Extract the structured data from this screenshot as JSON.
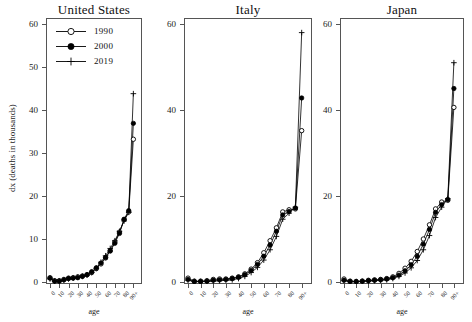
{
  "figure": {
    "ylabel": "dx (deaths in thousands)",
    "xlabel": "age"
  },
  "legend": {
    "entries": [
      {
        "label": "1990",
        "marker": "open-circle",
        "color": "#000000"
      },
      {
        "label": "2000",
        "marker": "filled-circle",
        "color": "#000000"
      },
      {
        "label": "2019",
        "marker": "plus",
        "color": "#000000"
      }
    ]
  },
  "chart_data": [
    {
      "type": "line",
      "title": "United States",
      "xlabel": "age",
      "ylabel": "dx (deaths in thousands)",
      "xlim": [
        0,
        95
      ],
      "ylim": [
        0,
        60
      ],
      "yticks": [
        0,
        10,
        20,
        30,
        40,
        50,
        60
      ],
      "xticks": [
        "0",
        "10",
        "20",
        "30",
        "40",
        "50",
        "60",
        "70",
        "80",
        "90+"
      ],
      "grid": false,
      "legend_position": "top-left",
      "x": [
        0,
        5,
        10,
        15,
        20,
        25,
        30,
        35,
        40,
        45,
        50,
        55,
        60,
        65,
        70,
        75,
        80,
        85,
        90
      ],
      "series": [
        {
          "name": "1990",
          "marker": "open-circle",
          "values": [
            1.0,
            0.3,
            0.3,
            0.6,
            0.9,
            1.0,
            1.2,
            1.4,
            1.7,
            2.2,
            3.1,
            4.2,
            5.6,
            7.3,
            9.3,
            11.6,
            14.5,
            16.3,
            33.2
          ]
        },
        {
          "name": "2000",
          "marker": "filled-circle",
          "values": [
            0.9,
            0.2,
            0.2,
            0.5,
            0.8,
            0.9,
            1.0,
            1.3,
            1.7,
            2.4,
            3.3,
            4.4,
            5.7,
            7.2,
            9.0,
            11.3,
            14.6,
            16.6,
            36.9
          ]
        },
        {
          "name": "2019",
          "marker": "plus",
          "values": [
            0.7,
            0.2,
            0.2,
            0.4,
            0.7,
            0.9,
            1.1,
            1.3,
            1.6,
            2.2,
            3.2,
            4.6,
            6.1,
            7.8,
            9.6,
            11.8,
            14.2,
            16.2,
            43.8
          ]
        }
      ]
    },
    {
      "type": "line",
      "title": "Italy",
      "xlabel": "age",
      "ylabel": "",
      "xlim": [
        0,
        95
      ],
      "ylim": [
        0,
        60
      ],
      "yticks": [
        0,
        20,
        40,
        60
      ],
      "xticks": [
        "0",
        "10",
        "20",
        "30",
        "40",
        "50",
        "60",
        "70",
        "80",
        "90+"
      ],
      "grid": false,
      "x": [
        0,
        5,
        10,
        15,
        20,
        25,
        30,
        35,
        40,
        45,
        50,
        55,
        60,
        65,
        70,
        75,
        80,
        85,
        90
      ],
      "series": [
        {
          "name": "1990",
          "marker": "open-circle",
          "values": [
            0.9,
            0.2,
            0.2,
            0.3,
            0.6,
            0.7,
            0.7,
            0.9,
            1.2,
            1.9,
            3.0,
            4.5,
            6.8,
            9.6,
            12.6,
            16.3,
            16.8,
            17.0,
            35.2
          ]
        },
        {
          "name": "2000",
          "marker": "filled-circle",
          "values": [
            0.6,
            0.1,
            0.1,
            0.2,
            0.4,
            0.5,
            0.6,
            0.8,
            1.1,
            1.7,
            2.7,
            4.1,
            6.0,
            8.6,
            11.8,
            15.6,
            16.4,
            17.2,
            42.8
          ]
        },
        {
          "name": "2019",
          "marker": "plus",
          "values": [
            0.4,
            0.1,
            0.1,
            0.1,
            0.2,
            0.3,
            0.4,
            0.5,
            0.8,
            1.3,
            2.2,
            3.4,
            5.1,
            7.5,
            10.6,
            14.6,
            16.0,
            17.4,
            58.0
          ]
        }
      ]
    },
    {
      "type": "line",
      "title": "Japan",
      "xlabel": "age",
      "ylabel": "",
      "xlim": [
        0,
        95
      ],
      "ylim": [
        0,
        60
      ],
      "yticks": [
        0,
        20,
        40,
        60
      ],
      "xticks": [
        "0",
        "10",
        "20",
        "30",
        "40",
        "50",
        "60",
        "70",
        "80",
        "90+"
      ],
      "grid": false,
      "x": [
        0,
        5,
        10,
        15,
        20,
        25,
        30,
        35,
        40,
        45,
        50,
        55,
        60,
        65,
        70,
        75,
        80,
        85,
        90
      ],
      "series": [
        {
          "name": "1990",
          "marker": "open-circle",
          "values": [
            0.7,
            0.2,
            0.1,
            0.2,
            0.4,
            0.5,
            0.6,
            0.8,
            1.2,
            2.0,
            3.2,
            4.8,
            7.1,
            10.0,
            13.3,
            17.0,
            18.6,
            19.0,
            40.6
          ]
        },
        {
          "name": "2000",
          "marker": "filled-circle",
          "values": [
            0.4,
            0.1,
            0.1,
            0.2,
            0.3,
            0.4,
            0.5,
            0.7,
            1.0,
            1.6,
            2.6,
            4.0,
            6.0,
            8.8,
            12.2,
            16.2,
            18.0,
            19.2,
            45.0
          ]
        },
        {
          "name": "2019",
          "marker": "plus",
          "values": [
            0.3,
            0.1,
            0.1,
            0.1,
            0.2,
            0.3,
            0.4,
            0.5,
            0.8,
            1.3,
            2.1,
            3.3,
            5.0,
            7.5,
            10.8,
            15.0,
            17.4,
            19.4,
            51.0
          ]
        }
      ]
    }
  ]
}
